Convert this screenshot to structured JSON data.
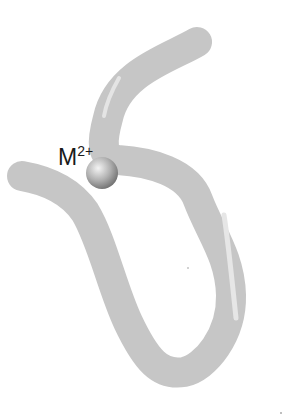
{
  "diagram": {
    "tube_color": "#c4c4c4",
    "highlight_color": "#e6e6e6",
    "ion": {
      "label_base": "M",
      "label_charge": "2+",
      "fill_light": "#f2f2f2",
      "fill_dark": "#7a7a7a"
    }
  }
}
